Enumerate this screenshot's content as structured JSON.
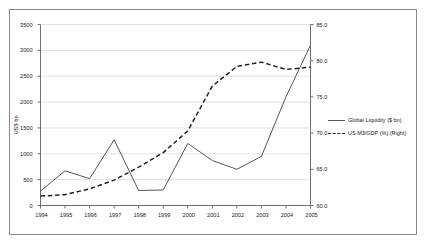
{
  "chart_data": {
    "type": "line",
    "title": "",
    "xlabel": "",
    "ylabel": "US$ bn",
    "y2label": "",
    "categories": [
      "1994",
      "1995",
      "1996",
      "1997",
      "1998",
      "1999",
      "2000",
      "2001",
      "2002",
      "2003",
      "2004",
      "2005"
    ],
    "ylim": [
      0,
      3500
    ],
    "y2lim": [
      60.0,
      85.0
    ],
    "yticks": [
      "0",
      "500",
      "1000",
      "1500",
      "2000",
      "2500",
      "3000",
      "3500"
    ],
    "y2ticks": [
      "60.0",
      "65.0",
      "70.0",
      "75.0",
      "80.0",
      "85.0"
    ],
    "grid": true,
    "legend_position": "right",
    "series": [
      {
        "name": "Global Liquidity ($ bn)",
        "axis": "left",
        "style": "solid",
        "color": "#555555",
        "values": [
          280,
          670,
          520,
          1270,
          290,
          300,
          1200,
          870,
          700,
          950,
          2100,
          3100
        ]
      },
      {
        "name": "US M3/GDP (%) (Right)",
        "axis": "right",
        "style": "dashed",
        "color": "#222222",
        "values": [
          61.3,
          61.5,
          62.3,
          63.5,
          65.3,
          67.3,
          70.3,
          76.5,
          79.2,
          79.8,
          78.8,
          79.1
        ]
      }
    ]
  },
  "legend": {
    "items": [
      {
        "label": "Global Liquidity ($ bn)",
        "style": "solid"
      },
      {
        "label": "US M3/GDP (%) (Right)",
        "style": "dashed"
      }
    ]
  },
  "axes": {
    "y_left_title": "US$ bn"
  },
  "colors": {
    "frame_border": "#8a8a8a",
    "gridline": "#d9d9d9",
    "axis_line": "#707070",
    "series_solid": "#555555",
    "series_dashed": "#222222",
    "text": "#1a1a1a",
    "background": "#ffffff"
  }
}
